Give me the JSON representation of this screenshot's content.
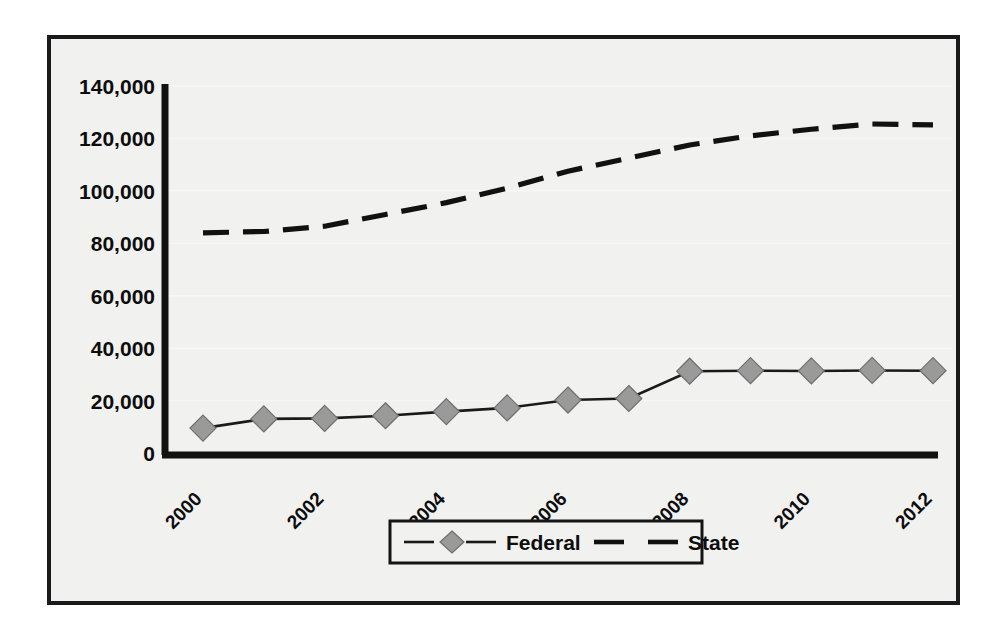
{
  "chart_data": {
    "type": "line",
    "title": "",
    "xlabel": "",
    "ylabel": "",
    "x": [
      2000,
      2001,
      2002,
      2003,
      2004,
      2005,
      2006,
      2007,
      2008,
      2009,
      2010,
      2011,
      2012
    ],
    "xtick_labels": [
      "2000",
      "2002",
      "2004",
      "2006",
      "2008",
      "2010",
      "2012"
    ],
    "xtick_values": [
      2000,
      2002,
      2004,
      2006,
      2008,
      2010,
      2012
    ],
    "ytick_labels": [
      "0",
      "20,000",
      "40,000",
      "60,000",
      "80,000",
      "100,000",
      "120,000",
      "140,000"
    ],
    "ytick_values": [
      0,
      20000,
      40000,
      60000,
      80000,
      100000,
      120000,
      140000
    ],
    "ylim": [
      0,
      140000
    ],
    "xlim": [
      2000,
      2012
    ],
    "grid": true,
    "legend_position": "bottom",
    "series": [
      {
        "name": "Federal",
        "style": "solid",
        "marker": "diamond",
        "marker_color": "#9a9a9a",
        "line_color": "#1a1a1a",
        "values": [
          9500,
          13000,
          13200,
          14200,
          15800,
          17200,
          20200,
          20800,
          31200,
          31400,
          31300,
          31500,
          31400
        ]
      },
      {
        "name": "State",
        "style": "dashed",
        "marker": "none",
        "line_color": "#111111",
        "values": [
          84000,
          84500,
          86500,
          91000,
          95500,
          101000,
          107500,
          112500,
          117500,
          121000,
          123500,
          125500,
          125200
        ]
      }
    ]
  },
  "legend": {
    "entries": [
      {
        "label": "Federal",
        "marker": "diamond",
        "line": "solid"
      },
      {
        "label": "State",
        "marker": "none",
        "line": "dashed"
      }
    ]
  },
  "colors": {
    "background": "#f1f1f0",
    "frame": "#1a1a1a",
    "axis": "#111111",
    "federal_line": "#1a1a1a",
    "federal_marker": "#9a9a9a",
    "state_line": "#111111",
    "gridline": "#f7f7f6"
  }
}
